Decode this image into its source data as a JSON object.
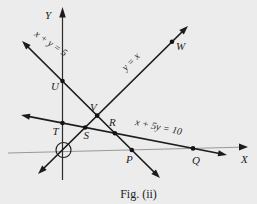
{
  "figure": {
    "caption": "Fig. (ii)",
    "axes": {
      "x_label": "X",
      "y_label": "Y"
    },
    "lines": {
      "xy5": {
        "equation": "x + y = 5",
        "passes_through_points": [
          "U",
          "V",
          "R",
          "P"
        ]
      },
      "yx": {
        "equation": "y = x",
        "passes_through_points": [
          "S",
          "V",
          "W"
        ]
      },
      "x5y10": {
        "equation": "x + 5y = 10",
        "passes_through_points": [
          "T",
          "S",
          "R",
          "Q"
        ]
      }
    },
    "points": {
      "U": "U",
      "V": "V",
      "T": "T",
      "S": "S",
      "R": "R",
      "P": "P",
      "Q": "Q",
      "W": "W"
    },
    "annotations": {
      "origin_marker": "circle-around-origin"
    },
    "colors": {
      "ink": "#1c1c1c",
      "axis_line": "#8e8e8e",
      "background": "#ececec"
    }
  }
}
